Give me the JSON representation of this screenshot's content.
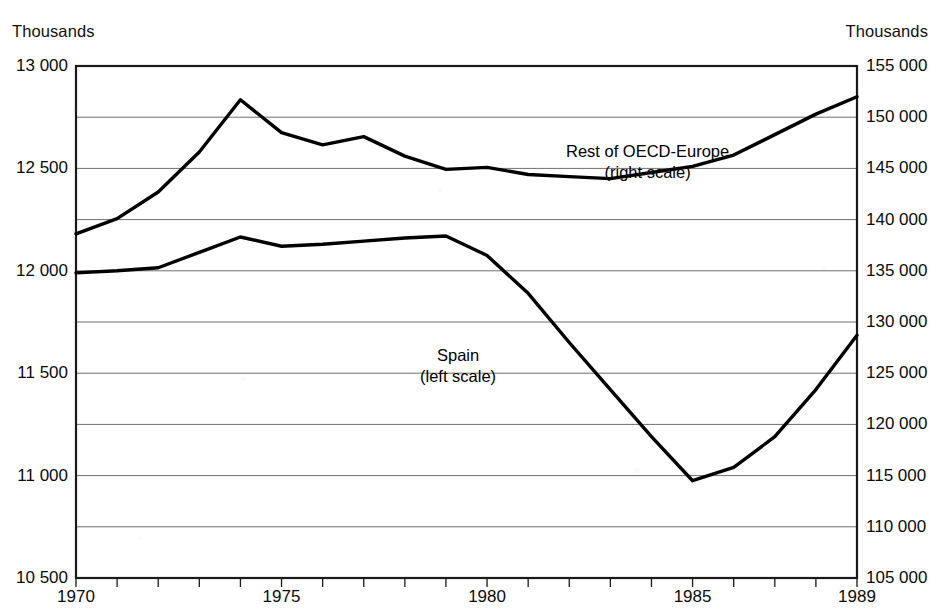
{
  "chart_data": {
    "type": "line",
    "title": "",
    "subtitle": "",
    "xlabel": "",
    "left_axis": {
      "unit_label": "Thousands",
      "ylim": [
        10500,
        13000
      ],
      "tick_values": [
        13000,
        12500,
        12000,
        11500,
        11000,
        10500
      ],
      "tick_labels": [
        "13 000",
        "12 500",
        "12 000",
        "11 500",
        "11 000",
        "10 500"
      ],
      "minor_gridline_values": [
        12750,
        12250,
        11750,
        11250,
        10750
      ]
    },
    "right_axis": {
      "unit_label": "Thousands",
      "ylim": [
        105000,
        155000
      ],
      "tick_values": [
        155000,
        150000,
        145000,
        140000,
        135000,
        130000,
        125000,
        120000,
        115000,
        110000,
        105000
      ],
      "tick_labels": [
        "155 000",
        "150 000",
        "145 000",
        "140 000",
        "135 000",
        "130 000",
        "125 000",
        "120 000",
        "115 000",
        "110 000",
        "105 000"
      ]
    },
    "x": [
      1970,
      1971,
      1972,
      1973,
      1974,
      1975,
      1976,
      1977,
      1978,
      1979,
      1980,
      1981,
      1982,
      1983,
      1984,
      1985,
      1986,
      1987,
      1988,
      1989
    ],
    "xlim": [
      1970,
      1989
    ],
    "xtick_values": [
      1970,
      1975,
      1980,
      1985,
      1989
    ],
    "xtick_labels": [
      "1970",
      "1975",
      "1980",
      "1985",
      "1989"
    ],
    "grid": true,
    "legend": "annotated-inline",
    "series": [
      {
        "name": "Spain",
        "scale": "left",
        "annotation": "Spain",
        "annotation_scale_note": "(left scale)",
        "values": [
          11990,
          12000,
          12015,
          12090,
          12165,
          12120,
          12130,
          12145,
          12160,
          12170,
          12075,
          11890,
          11650,
          11420,
          11190,
          10975,
          11040,
          11190,
          11420,
          11685
        ]
      },
      {
        "name": "Rest of OECD-Europe",
        "scale": "right",
        "annotation": "Rest of OECD-Europe",
        "annotation_scale_note": "(right scale)",
        "values": [
          138600,
          140100,
          142700,
          146600,
          151700,
          148500,
          147300,
          148100,
          146200,
          144900,
          145100,
          144400,
          144200,
          144000,
          144600,
          145200,
          146300,
          148300,
          150300,
          152000
        ]
      }
    ]
  },
  "axes": {
    "left_unit": "Thousands",
    "right_unit": "Thousands"
  },
  "annotations": {
    "oecd_line1": "Rest of OECD-Europe",
    "oecd_line2": "(right scale)",
    "spain_line1": "Spain",
    "spain_line2": "(left scale)"
  },
  "colors": {
    "series_line": "#000000",
    "gridline": "#6f6f6f",
    "frame": "#1a1a1a",
    "background": "#ffffff",
    "text": "#0b0b0b"
  }
}
